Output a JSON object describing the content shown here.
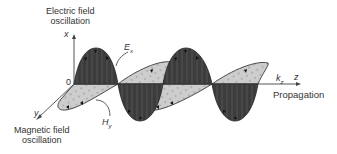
{
  "diagram": {
    "type": "electromagnetic-wave",
    "labels": {
      "electric_title_line1": "Electric field",
      "electric_title_line2": "oscillation",
      "magnetic_title_line1": "Magnetic field",
      "magnetic_title_line2": "oscillation",
      "propagation": "Propagation",
      "axis_x": "x",
      "axis_y": "y",
      "axis_z": "z",
      "origin": "0",
      "E_field": "E",
      "E_sub": "x",
      "H_field": "H",
      "H_sub": "y",
      "k_vec": "k",
      "k_sub": "z"
    },
    "colors": {
      "electric_fill": "#3a3a3a",
      "magnetic_fill": "#c8c8c8",
      "outline": "#222222",
      "axis": "#444444",
      "text": "#333333"
    }
  }
}
